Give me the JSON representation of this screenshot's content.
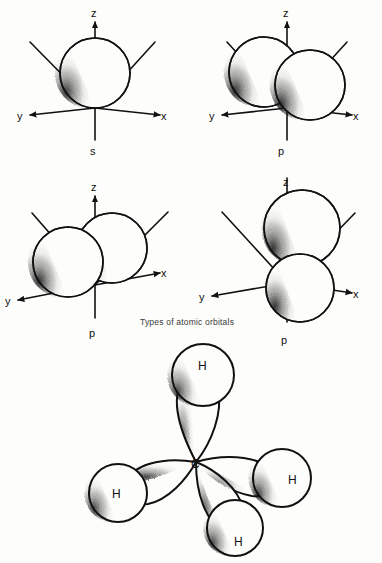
{
  "figure": {
    "caption": "Types of atomic orbitals",
    "stroke_color": "#111111",
    "background_color": "#fdfdfb",
    "dash_color": "#222222"
  },
  "panels": [
    {
      "id": "s-orbital",
      "orbital_label": "s",
      "position": "top-left",
      "axes": [
        {
          "label": "z",
          "direction": "up"
        },
        {
          "label": "x",
          "direction": "down-right"
        },
        {
          "label": "y",
          "direction": "down-left"
        }
      ],
      "lobes": 1,
      "shape": "single sphere centered at origin"
    },
    {
      "id": "px-orbital",
      "orbital_label": "p",
      "position": "top-right",
      "axes": [
        {
          "label": "z",
          "direction": "up"
        },
        {
          "label": "x",
          "direction": "down-right"
        },
        {
          "label": "y",
          "direction": "down-left"
        }
      ],
      "lobes": 2,
      "shape": "two spheres offset along x axis"
    },
    {
      "id": "py-orbital",
      "orbital_label": "p",
      "position": "bottom-left",
      "axes": [
        {
          "label": "z",
          "direction": "up"
        },
        {
          "label": "x",
          "direction": "down-right"
        },
        {
          "label": "y",
          "direction": "down-left"
        }
      ],
      "lobes": 2,
      "shape": "two spheres offset along y axis"
    },
    {
      "id": "pz-orbital",
      "orbital_label": "p",
      "position": "bottom-right",
      "axes": [
        {
          "label": "z",
          "direction": "up"
        },
        {
          "label": "x",
          "direction": "down-right"
        },
        {
          "label": "y",
          "direction": "down-left"
        }
      ],
      "lobes": 2,
      "shape": "two spheres stacked along z axis"
    }
  ],
  "molecule": {
    "id": "methane-sp3",
    "center_atom": "C",
    "bonded_atoms": [
      "H",
      "H",
      "H",
      "H"
    ],
    "hydrogen_labels": {
      "top": "H",
      "left": "H",
      "right": "H",
      "bottom": "H"
    },
    "geometry": "tetrahedral",
    "lobe_count": 4,
    "bond_style": "dashed"
  }
}
